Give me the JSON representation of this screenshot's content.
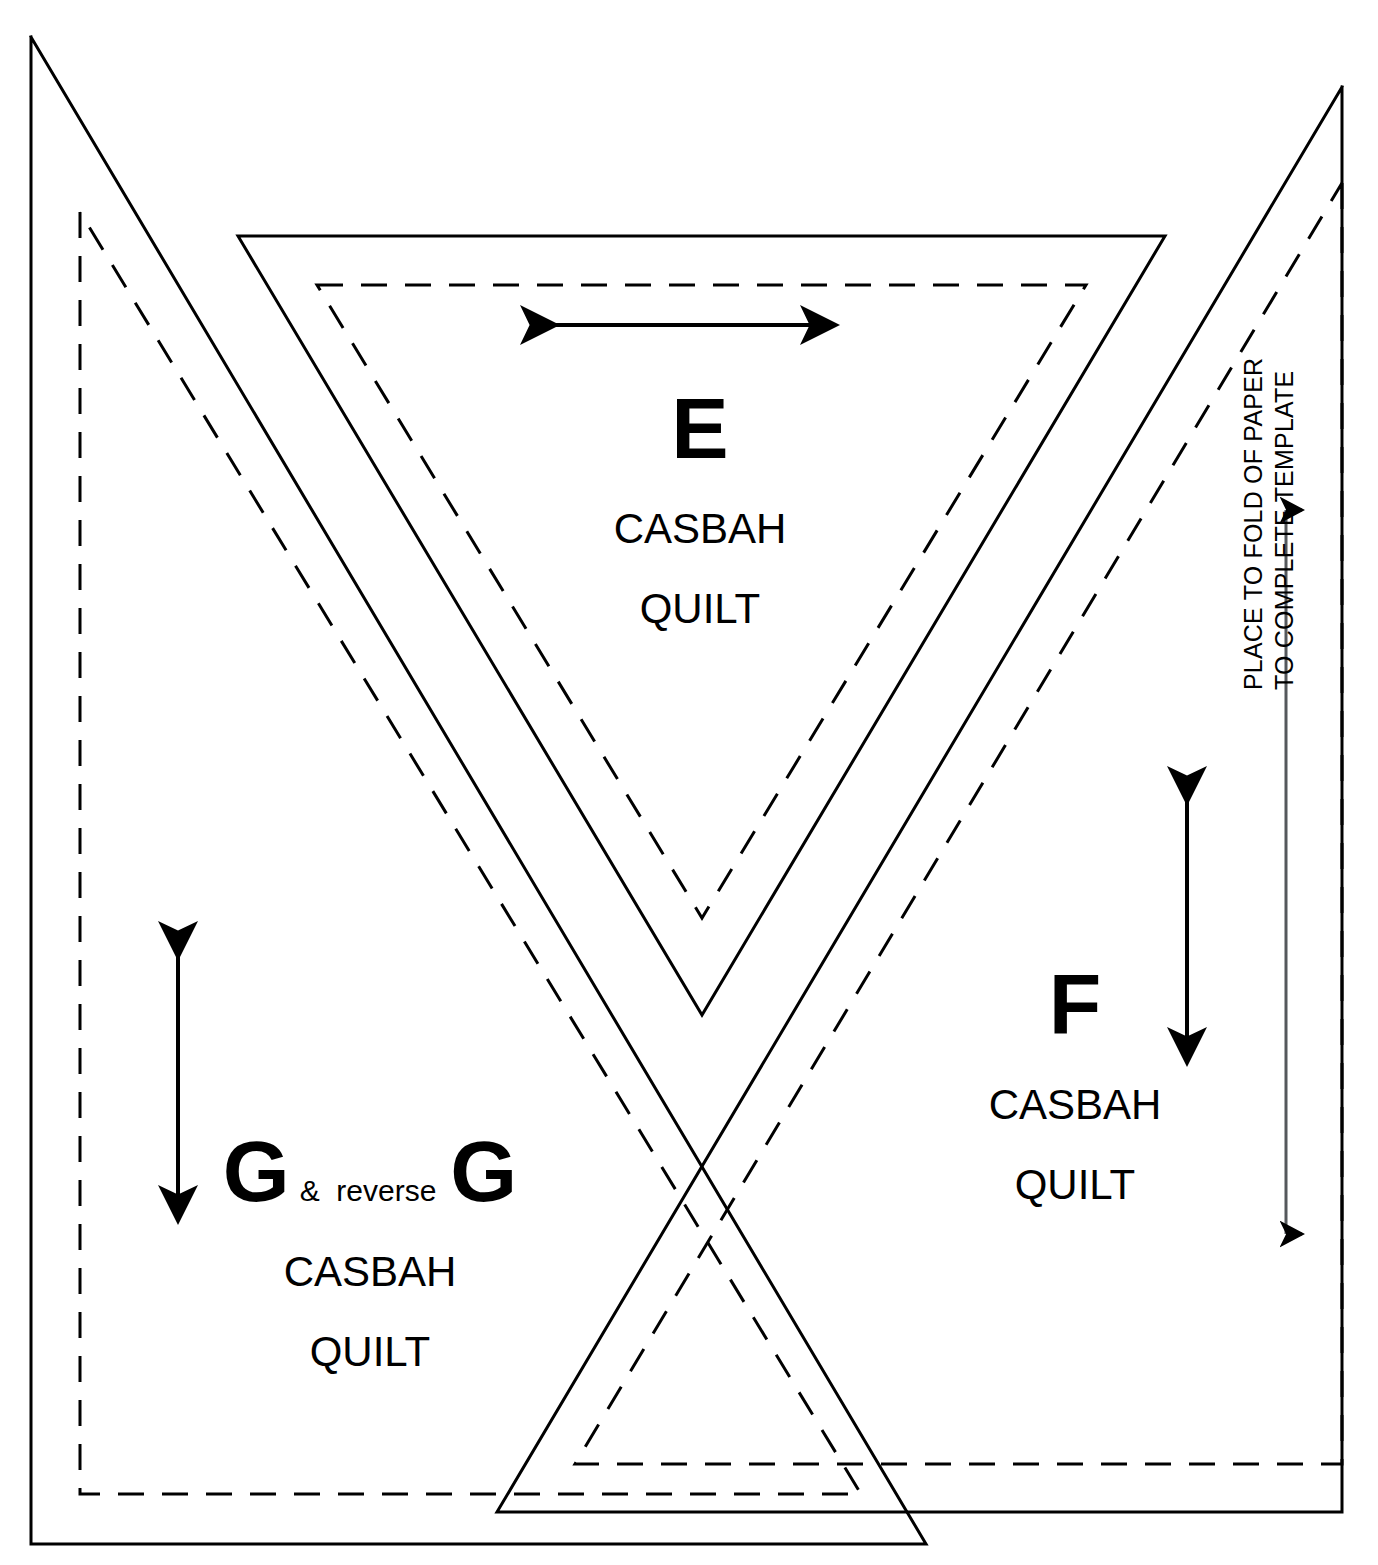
{
  "document": {
    "title": "Casbah Quilt Templates E F G",
    "type": "quilt pattern template sheet",
    "background_color": "#ffffff",
    "line_color": "#000000"
  },
  "templates": [
    {
      "id": "E",
      "letter": "E",
      "name_line1": "CASBAH",
      "name_line2": "QUILT",
      "shape": "inverted triangle",
      "grainline": "horizontal double arrow"
    },
    {
      "id": "F",
      "letter": "F",
      "name_line1": "CASBAH",
      "name_line2": "QUILT",
      "shape": "right triangle",
      "grainline": "vertical double arrow"
    },
    {
      "id": "G",
      "letter_left": "G",
      "amp": "&  reverse",
      "letter_right": "G",
      "name_line1": "CASBAH",
      "name_line2": "QUILT",
      "shape": "right triangle",
      "grainline": "vertical double arrow"
    }
  ],
  "fold_note": {
    "line1": "PLACE TO FOLD OF PAPER",
    "line2": "TO COMPLETE TEMPLATE"
  },
  "geometry": {
    "solid_stroke_width": 3,
    "dashed_stroke_width": 3,
    "dash_pattern": "26 18",
    "arrow_stroke_width": 4
  }
}
